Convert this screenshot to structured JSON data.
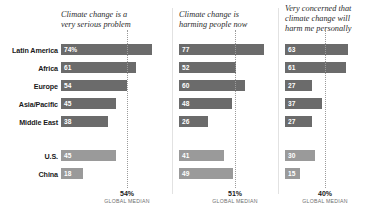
{
  "chart_data": {
    "type": "bar",
    "orientation": "horizontal",
    "title": "",
    "xlabel": "",
    "ylabel": "",
    "xlim": [
      0,
      100
    ],
    "grid": false,
    "legend": "none",
    "value_suffix_first_row": "%",
    "categories": [
      "Latin America",
      "Africa",
      "Europe",
      "Asia/Pacific",
      "Middle East",
      "U.S.",
      "China"
    ],
    "category_groups": [
      {
        "name": "regions",
        "members": [
          "Latin America",
          "Africa",
          "Europe",
          "Asia/Pacific",
          "Middle East"
        ]
      },
      {
        "name": "countries",
        "members": [
          "U.S.",
          "China"
        ]
      }
    ],
    "series": [
      {
        "name": "Climate change is a very serious problem",
        "values": [
          74,
          61,
          54,
          45,
          38,
          45,
          18
        ],
        "labels": [
          "74%",
          "61",
          "54",
          "45",
          "38",
          "45",
          "18"
        ],
        "median": 40,
        "median_label": "54%",
        "median_caption": "GLOBAL MEDIAN",
        "median_value": 54
      },
      {
        "name": "Climate change is harming people now",
        "values": [
          77,
          52,
          60,
          48,
          26,
          41,
          49
        ],
        "labels": [
          "77",
          "52",
          "60",
          "48",
          "26",
          "41",
          "49"
        ],
        "median_label": "51%",
        "median_caption": "GLOBAL MEDIAN",
        "median_value": 51
      },
      {
        "name": "Very concerned that climate change will harm me personally",
        "values": [
          63,
          61,
          27,
          37,
          27,
          30,
          15
        ],
        "labels": [
          "63",
          "61",
          "27",
          "37",
          "27",
          "30",
          "15"
        ],
        "median_label": "40%",
        "median_caption": "GLOBAL MEDIAN",
        "median_value": 40
      }
    ],
    "colors": {
      "region_bar": "#6b6b6b",
      "country_bar": "#9a9a9a",
      "median_line": "#9b9b9b",
      "value_text": "#ffffff",
      "label_text": "#1a1a1a",
      "title_text": "#2b2b2b",
      "caption_text": "#6f6f6f",
      "background": "#ffffff"
    }
  },
  "panels": [
    {
      "title_line1": "Climate change is a",
      "title_line2": "very serious problem",
      "median_pct": "54%",
      "median_sub": "GLOBAL MEDIAN"
    },
    {
      "title_line1": "Climate change is",
      "title_line2": "harming people now",
      "median_pct": "51%",
      "median_sub": "GLOBAL MEDIAN"
    },
    {
      "title_line1": "Very concerned that",
      "title_line2": "climate change will",
      "title_line3": "harm me personally",
      "median_pct": "40%",
      "median_sub": "GLOBAL MEDIAN"
    }
  ],
  "rows": [
    {
      "label": "Latin America"
    },
    {
      "label": "Africa"
    },
    {
      "label": "Europe"
    },
    {
      "label": "Asia/Pacific"
    },
    {
      "label": "Middle East"
    },
    {
      "label": "U.S."
    },
    {
      "label": "China"
    }
  ]
}
